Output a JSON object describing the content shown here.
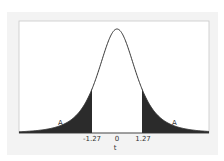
{
  "chart_data": {
    "type": "area",
    "title": "",
    "distribution": "t",
    "xlabel": "t",
    "ylabel": "",
    "x_ticks": [
      "-1.27",
      "0",
      "1.27"
    ],
    "shaded_regions": [
      {
        "from": "-inf",
        "to": -1.27,
        "label": "A"
      },
      {
        "from": 1.27,
        "to": "inf",
        "label": "A"
      }
    ],
    "critical_values": [
      -1.27,
      1.27
    ],
    "center": 0,
    "grid": false,
    "legend": "none",
    "fill_color": "#2b2b2b",
    "line_color": "#333333"
  },
  "labels": {
    "left_tail": "A",
    "right_tail": "A",
    "tick_neg": "-1.27",
    "tick_zero": "0",
    "tick_pos": "1.27",
    "xlabel": "t"
  }
}
